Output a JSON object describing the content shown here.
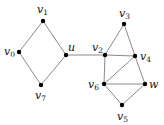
{
  "diagram": {
    "type": "undirected-graph",
    "nodes": [
      {
        "id": "v0",
        "label": "v",
        "sub": "0",
        "x": 19,
        "y": 52,
        "lx": 4,
        "ly": 55
      },
      {
        "id": "v1",
        "label": "v",
        "sub": "1",
        "x": 43,
        "y": 21,
        "lx": 37,
        "ly": 13
      },
      {
        "id": "u",
        "label": "u",
        "sub": "",
        "x": 66,
        "y": 55,
        "lx": 68,
        "ly": 51
      },
      {
        "id": "v7",
        "label": "v",
        "sub": "7",
        "x": 41,
        "y": 85,
        "lx": 35,
        "ly": 99
      },
      {
        "id": "v2",
        "label": "v",
        "sub": "2",
        "x": 105,
        "y": 55,
        "lx": 92,
        "ly": 51
      },
      {
        "id": "v3",
        "label": "v",
        "sub": "3",
        "x": 124,
        "y": 24,
        "lx": 119,
        "ly": 17
      },
      {
        "id": "v4",
        "label": "v",
        "sub": "4",
        "x": 135,
        "y": 56,
        "lx": 140,
        "ly": 60
      },
      {
        "id": "v6",
        "label": "v",
        "sub": "6",
        "x": 104,
        "y": 84,
        "lx": 88,
        "ly": 88
      },
      {
        "id": "w",
        "label": "w",
        "sub": "",
        "x": 145,
        "y": 84,
        "lx": 149,
        "ly": 88
      },
      {
        "id": "v5",
        "label": "v",
        "sub": "5",
        "x": 122,
        "y": 105,
        "lx": 117,
        "ly": 120
      }
    ],
    "edges": [
      [
        "v1",
        "v0"
      ],
      [
        "v1",
        "u"
      ],
      [
        "v0",
        "v7"
      ],
      [
        "v7",
        "u"
      ],
      [
        "u",
        "v2"
      ],
      [
        "v2",
        "v3"
      ],
      [
        "v2",
        "v4"
      ],
      [
        "v2",
        "v6"
      ],
      [
        "v3",
        "v4"
      ],
      [
        "v4",
        "v6"
      ],
      [
        "v4",
        "w"
      ],
      [
        "v6",
        "w"
      ],
      [
        "v6",
        "v5"
      ],
      [
        "v5",
        "w"
      ]
    ],
    "colors": {
      "edge": "#8a8a8a",
      "node": "#000000",
      "label": "#111111"
    }
  }
}
